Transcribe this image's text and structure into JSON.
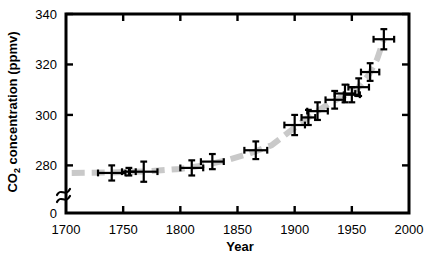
{
  "chart_data": {
    "type": "scatter",
    "title": "",
    "subtitle": "",
    "xlabel": "Year",
    "ylabel": "CO2 concentration (ppmv)",
    "ylabel_parts": {
      "lead": "CO",
      "subscript": "2",
      "trail": " concentration (ppmv)"
    },
    "xlim": [
      1700,
      2000
    ],
    "ylim": [
      275,
      340
    ],
    "y_axis_break": true,
    "y_axis_break_note": "axis broken between 0 and 275",
    "grid": false,
    "legend": false,
    "xticks": [
      1700,
      1750,
      1800,
      1850,
      1900,
      1950,
      2000
    ],
    "xtick_labels": [
      "1700",
      "1750",
      "1800",
      "1850",
      "1900",
      "1950",
      "2000"
    ],
    "yticks": [
      0,
      280,
      300,
      320,
      340
    ],
    "ytick_labels": [
      "0",
      "280",
      "300",
      "320",
      "340"
    ],
    "series": [
      {
        "name": "Ice core CO2 measurements",
        "marker": "cross-error-bar",
        "color": "#000000",
        "points": [
          {
            "x": 1740,
            "y": 277.0,
            "xerr": 12,
            "yerr": 3.0
          },
          {
            "x": 1755,
            "y": 277.5,
            "xerr": 6,
            "yerr": 1.5
          },
          {
            "x": 1768,
            "y": 277.5,
            "xerr": 12,
            "yerr": 4.0
          },
          {
            "x": 1810,
            "y": 279.0,
            "xerr": 10,
            "yerr": 3.0
          },
          {
            "x": 1828,
            "y": 281.5,
            "xerr": 10,
            "yerr": 3.0
          },
          {
            "x": 1866,
            "y": 286.0,
            "xerr": 10,
            "yerr": 3.5
          },
          {
            "x": 1900,
            "y": 296.0,
            "xerr": 9,
            "yerr": 4.0
          },
          {
            "x": 1912,
            "y": 299.0,
            "xerr": 6,
            "yerr": 3.0
          },
          {
            "x": 1920,
            "y": 301.5,
            "xerr": 9,
            "yerr": 3.5
          },
          {
            "x": 1935,
            "y": 306.0,
            "xerr": 8,
            "yerr": 3.5
          },
          {
            "x": 1944,
            "y": 308.5,
            "xerr": 9,
            "yerr": 3.5
          },
          {
            "x": 1950,
            "y": 308.0,
            "xerr": 7,
            "yerr": 3.0
          },
          {
            "x": 1956,
            "y": 311.0,
            "xerr": 9,
            "yerr": 3.5
          },
          {
            "x": 1966,
            "y": 317.0,
            "xerr": 8,
            "yerr": 3.5
          },
          {
            "x": 1978,
            "y": 330.0,
            "xerr": 9,
            "yerr": 4.0
          }
        ]
      }
    ],
    "trend": {
      "name": "Smoothed trend",
      "style": "dashed",
      "color": "#c9c9c9",
      "width": 6,
      "points": [
        {
          "x": 1705,
          "y": 277.0
        },
        {
          "x": 1740,
          "y": 277.2
        },
        {
          "x": 1770,
          "y": 277.6
        },
        {
          "x": 1800,
          "y": 278.6
        },
        {
          "x": 1820,
          "y": 280.0
        },
        {
          "x": 1840,
          "y": 282.0
        },
        {
          "x": 1860,
          "y": 284.6
        },
        {
          "x": 1880,
          "y": 288.0
        },
        {
          "x": 1900,
          "y": 295.0
        },
        {
          "x": 1915,
          "y": 300.0
        },
        {
          "x": 1930,
          "y": 304.5
        },
        {
          "x": 1945,
          "y": 308.0
        },
        {
          "x": 1955,
          "y": 310.5
        },
        {
          "x": 1965,
          "y": 316.0
        },
        {
          "x": 1972,
          "y": 322.0
        },
        {
          "x": 1978,
          "y": 330.0
        }
      ]
    }
  }
}
